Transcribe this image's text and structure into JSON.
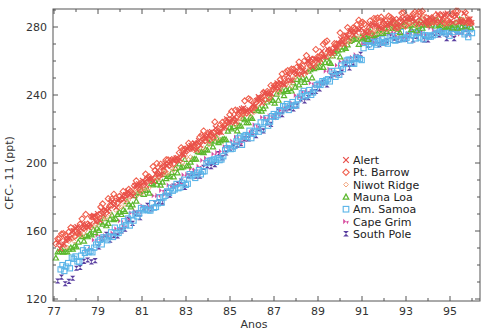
{
  "chart_data": {
    "type": "scatter",
    "title": "",
    "xlabel": "Anos",
    "ylabel": "CFC- 11 (ppt)",
    "xlim": [
      77,
      96.3
    ],
    "ylim": [
      119,
      293
    ],
    "x_ticks": [
      77,
      79,
      81,
      83,
      85,
      87,
      89,
      91,
      93,
      95
    ],
    "x_minor_ticks": [
      78,
      80,
      82,
      84,
      86,
      88,
      90,
      92,
      94,
      96
    ],
    "y_ticks": [
      120,
      160,
      200,
      240,
      280
    ],
    "y_minor_ticks": [
      130,
      140,
      150,
      170,
      180,
      190,
      210,
      220,
      230,
      250,
      260,
      270,
      290
    ],
    "grid": false,
    "legend_position": "center-right",
    "series": [
      {
        "name": "Alert",
        "marker": "x",
        "color": "#e8504a",
        "start_year": 77.2,
        "end_year": 96.0,
        "offset": 4
      },
      {
        "name": "Pt. Barrow",
        "marker": "diamond",
        "color": "#f0604e",
        "start_year": 77.0,
        "end_year": 96.0,
        "offset": 6
      },
      {
        "name": "Niwot Ridge",
        "marker": "diamond-small",
        "color": "#f2a37a",
        "start_year": 77.5,
        "end_year": 96.0,
        "offset": 2
      },
      {
        "name": "Mauna Loa",
        "marker": "triangle",
        "color": "#5cb82e",
        "start_year": 77.0,
        "end_year": 96.0,
        "offset": -2
      },
      {
        "name": "Am. Samoa",
        "marker": "square",
        "color": "#5ab4e8",
        "start_year": 77.3,
        "end_year": 96.0,
        "offset": -12
      },
      {
        "name": "Cape Grim",
        "marker": "bowtie",
        "color": "#d84fa0",
        "start_year": 78.5,
        "end_year": 96.0,
        "offset": -10
      },
      {
        "name": "South Pole",
        "marker": "hourglass",
        "color": "#5a3fa0",
        "start_year": 77.0,
        "end_year": 96.0,
        "offset": -13
      }
    ],
    "trend_description": "Northern hemisphere stations (Alert, Pt. Barrow) ~146 ppt in 1977 rising ~9 ppt/yr to ~270-280 ppt by 1991, then leveling at ~272-280 ppt through 1996; southern stations (Am. Samoa, South Pole, Cape Grim) lag by ~10-15 ppt and level near 265-272 ppt."
  },
  "legend": {
    "items": [
      {
        "label": "Alert"
      },
      {
        "label": "Pt. Barrow"
      },
      {
        "label": "Niwot Ridge"
      },
      {
        "label": "Mauna Loa"
      },
      {
        "label": "Am. Samoa"
      },
      {
        "label": "Cape Grim"
      },
      {
        "label": "South Pole"
      }
    ]
  },
  "axes": {
    "x_tick_labels": [
      "77",
      "79",
      "81",
      "83",
      "85",
      "87",
      "89",
      "91",
      "93",
      "95"
    ],
    "y_tick_labels": [
      "120",
      "160",
      "200",
      "240",
      "280"
    ]
  }
}
